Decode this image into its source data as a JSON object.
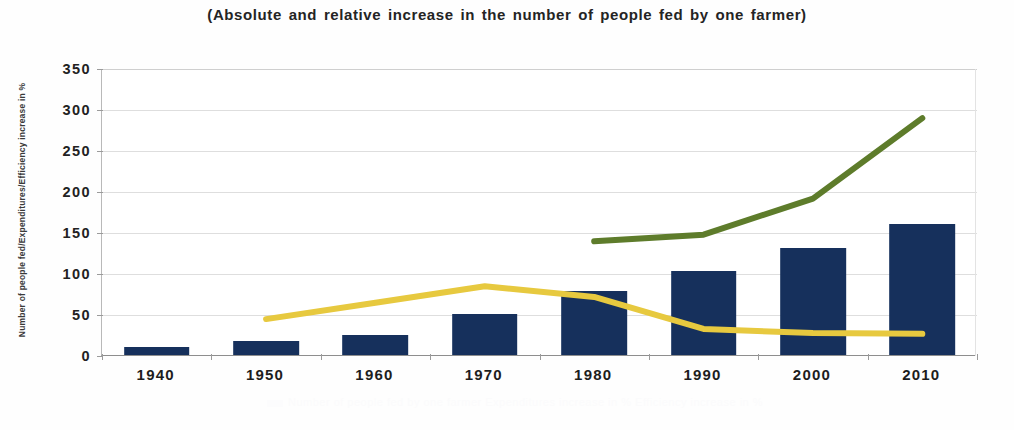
{
  "chart_data": {
    "type": "bar",
    "title": "(Absolute and relative increase in the number of people fed by one farmer)",
    "xlabel": "",
    "ylabel": "Number of people fed/Expenditures/Efficiency increase in %",
    "categories": [
      "1940",
      "1950",
      "1960",
      "1970",
      "1980",
      "1990",
      "2000",
      "2010"
    ],
    "ylim": [
      0,
      350
    ],
    "yticks": [
      0,
      50,
      100,
      150,
      200,
      250,
      300,
      350
    ],
    "ytick_labels": [
      "0",
      "50",
      "100",
      "150",
      "200",
      "250",
      "300",
      "350"
    ],
    "grid": true,
    "legend_position": "bottom",
    "series": [
      {
        "name": "Number of people fed by one farmer",
        "type": "bar",
        "color": "#16305c",
        "values": [
          10,
          17,
          25,
          50,
          78,
          102,
          130,
          160
        ]
      },
      {
        "name": "Expenditures increase in %",
        "type": "line",
        "color": "#e7c93f",
        "values": [
          null,
          45,
          65,
          85,
          72,
          33,
          28,
          27
        ]
      },
      {
        "name": "Efficiency increase in %",
        "type": "line",
        "color": "#5e7c2b",
        "values": [
          null,
          null,
          null,
          null,
          140,
          148,
          192,
          290
        ]
      }
    ]
  },
  "ghost_legend": {
    "text": "Number of people fed by one farmer    Expenditures increase in %    Efficiency increase in %"
  }
}
